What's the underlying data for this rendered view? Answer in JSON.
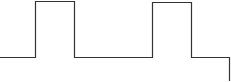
{
  "diagram": {
    "type": "pulse-waveform",
    "stroke_color": "#333333",
    "background": "#ffffff",
    "baseline_y": 57,
    "pulses": [
      {
        "x_start": 35,
        "x_end": 74,
        "top_y": 1
      },
      {
        "x_start": 152,
        "x_end": 191,
        "top_y": 2
      }
    ],
    "right_drop": {
      "x": 229,
      "y_start": 57,
      "y_end": 81
    }
  }
}
